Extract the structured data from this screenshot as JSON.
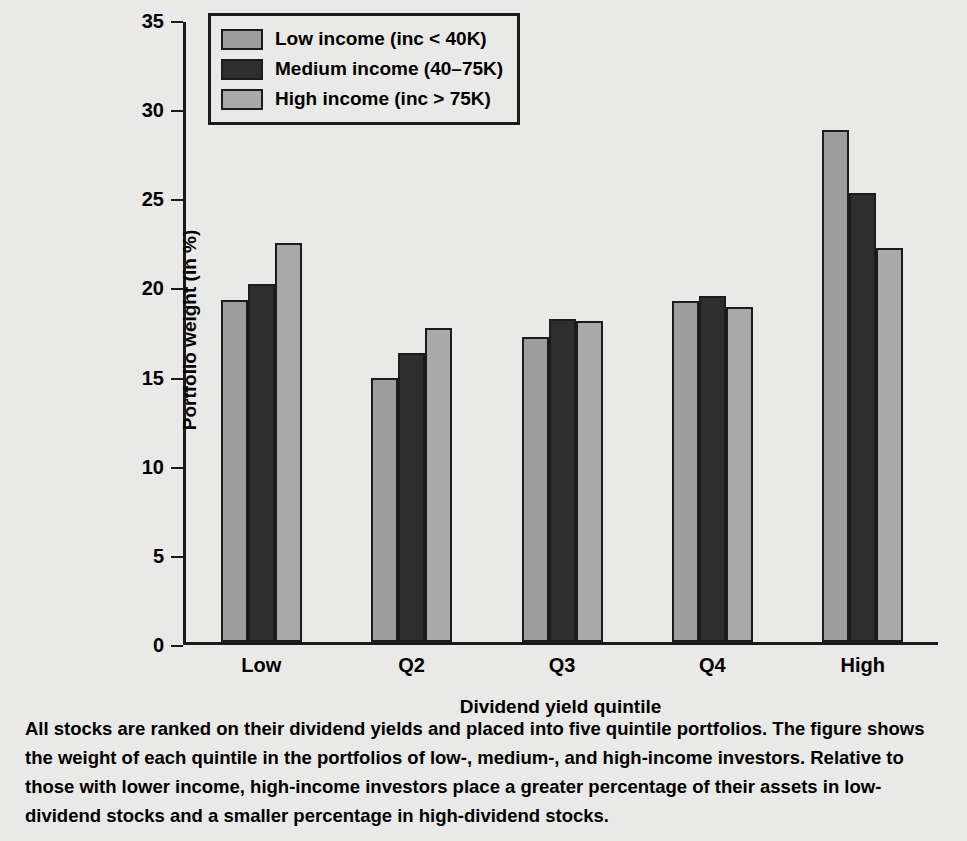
{
  "chart_data": {
    "type": "bar",
    "title": "",
    "xlabel": "Dividend yield quintile",
    "ylabel": "Portfolio weight (in %)",
    "categories": [
      "Low",
      "Q2",
      "Q3",
      "Q4",
      "High"
    ],
    "ylim": [
      0,
      35
    ],
    "yticks": [
      0,
      5,
      10,
      15,
      20,
      25,
      30,
      35
    ],
    "grid": false,
    "legend_position": "top-left",
    "series": [
      {
        "name": "Low income (inc < 40K)",
        "color": "#9d9d9d",
        "values": [
          19.2,
          14.8,
          17.1,
          19.1,
          28.7
        ]
      },
      {
        "name": "Medium income (40–75K)",
        "color": "#2e2e2e",
        "values": [
          20.1,
          16.2,
          18.1,
          19.4,
          25.2
        ]
      },
      {
        "name": "High income (inc > 75K)",
        "color": "#a9a9a9",
        "values": [
          22.4,
          17.6,
          18.0,
          18.8,
          22.1
        ]
      }
    ]
  },
  "caption": {
    "text": "All stocks are ranked on their dividend yields and placed into five quintile portfolios. The figure shows the weight of each quintile in the portfolios of low-, medium-, and high-income investors. Relative to those with lower income, high-income investors place a greater percentage of their assets in low-dividend stocks and a smaller percentage in high-dividend stocks."
  }
}
